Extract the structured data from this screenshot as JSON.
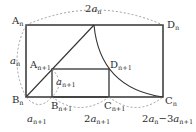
{
  "diagram": {
    "type": "geometry",
    "colors": {
      "line": "#333333",
      "dashed": "#888888",
      "background": "#ffffff"
    },
    "points": [
      {
        "id": "A_n",
        "base": "A",
        "sub": "n"
      },
      {
        "id": "B_n",
        "base": "B",
        "sub": "n"
      },
      {
        "id": "C_n",
        "base": "C",
        "sub": "n"
      },
      {
        "id": "D_n",
        "base": "D",
        "sub": "n"
      },
      {
        "id": "A_n1",
        "base": "A",
        "sub": "n+1"
      },
      {
        "id": "B_n1",
        "base": "B",
        "sub": "n+1"
      },
      {
        "id": "C_n1",
        "base": "C",
        "sub": "n+1"
      },
      {
        "id": "D_n1",
        "base": "D",
        "sub": "n+1"
      }
    ],
    "measures": {
      "top": {
        "coef": "2",
        "var": "a",
        "sub": "n"
      },
      "left": {
        "var": "a",
        "sub": "n"
      },
      "inner_height": {
        "var": "a",
        "sub": "n+1"
      },
      "bottom_1": {
        "var": "a",
        "sub": "n+1"
      },
      "bottom_2": {
        "coef": "2",
        "var": "a",
        "sub": "n+1"
      },
      "bottom_3": {
        "coef1": "2",
        "var1": "a",
        "sub1": "n",
        "minus": "−",
        "coef2": "3",
        "var2": "a",
        "sub2": "n+1"
      }
    }
  }
}
